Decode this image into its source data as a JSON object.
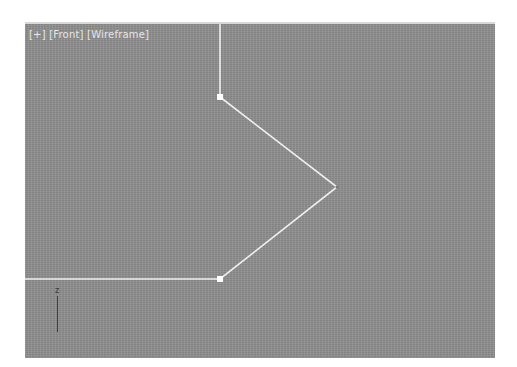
{
  "viewport": {
    "label_parts": [
      "[+]",
      "[Front]",
      "[Wireframe]"
    ],
    "label_menu": "[+]",
    "label_view": "[Front]",
    "label_shading": "[Wireframe]",
    "background_color": "#8f8f8f",
    "line_color": "#f0f0f0",
    "vertex_color": "#ffffff"
  },
  "shape": {
    "type": "spline",
    "vertices": [
      {
        "x": 195,
        "y": 0,
        "selected": false
      },
      {
        "x": 195,
        "y": 73,
        "selected": true
      },
      {
        "x": 312,
        "y": 163,
        "selected": false
      },
      {
        "x": 195,
        "y": 255,
        "selected": true
      },
      {
        "x": 0,
        "y": 255,
        "selected": false
      }
    ]
  },
  "axis_gizmo": {
    "axis_label": "z"
  }
}
